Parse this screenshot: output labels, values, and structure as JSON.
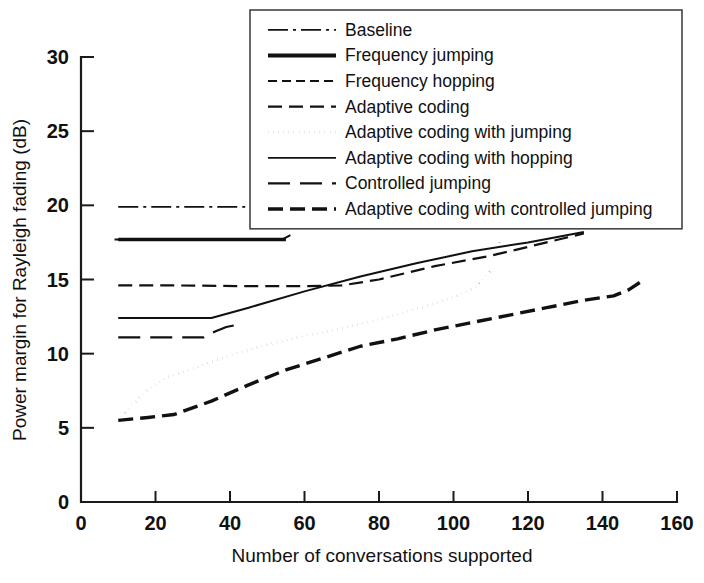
{
  "chart_data": {
    "type": "line",
    "title": "",
    "xlabel": "Number of conversations supported",
    "ylabel": "Power margin for Rayleigh fading (dB)",
    "xlim": [
      0,
      160
    ],
    "ylim": [
      0,
      30
    ],
    "xticks": [
      0,
      20,
      40,
      60,
      80,
      100,
      120,
      140,
      160
    ],
    "yticks": [
      0,
      5,
      10,
      15,
      20,
      25,
      30
    ],
    "xtick_labels": [
      "0",
      "20",
      "40",
      "60",
      "80",
      "100",
      "120",
      "140",
      "160"
    ],
    "ytick_labels": [
      "0",
      "5",
      "10",
      "15",
      "20",
      "25",
      "30"
    ],
    "grid": false,
    "legend_position": "top-center-right",
    "series": [
      {
        "name": "Baseline",
        "dash": "dashdot",
        "width": 1.8,
        "points": [
          [
            10,
            19.9
          ],
          [
            20,
            19.9
          ],
          [
            30,
            19.9
          ],
          [
            40,
            19.9
          ],
          [
            50,
            19.9
          ],
          [
            55,
            19.9
          ]
        ]
      },
      {
        "name": "Frequency jumping",
        "dash": "solid-thick",
        "width": 3.6,
        "points": [
          [
            10,
            17.7
          ],
          [
            20,
            17.7
          ],
          [
            30,
            17.7
          ],
          [
            40,
            17.7
          ],
          [
            50,
            17.7
          ],
          [
            55,
            17.7
          ]
        ]
      },
      {
        "name": "Frequency hopping",
        "dash": "dashed-short",
        "width": 2.0,
        "points": [
          [
            9,
            17.7
          ],
          [
            20,
            17.7
          ],
          [
            35,
            17.68
          ],
          [
            45,
            17.68
          ],
          [
            54,
            17.7
          ],
          [
            57,
            18.1
          ]
        ]
      },
      {
        "name": "Adaptive coding",
        "dash": "dashed-medium",
        "width": 2.2,
        "points": [
          [
            10,
            14.6
          ],
          [
            25,
            14.6
          ],
          [
            45,
            14.55
          ],
          [
            60,
            14.55
          ],
          [
            70,
            14.6
          ],
          [
            80,
            15.0
          ],
          [
            95,
            15.9
          ],
          [
            110,
            16.6
          ],
          [
            125,
            17.5
          ],
          [
            135,
            18.1
          ]
        ]
      },
      {
        "name": "Adaptive coding with jumping",
        "dash": "dotted",
        "width": 2.6,
        "points": [
          [
            10,
            5.5
          ],
          [
            14,
            6.6
          ],
          [
            18,
            7.6
          ],
          [
            23,
            8.4
          ],
          [
            30,
            9.0
          ],
          [
            40,
            9.9
          ],
          [
            50,
            10.6
          ],
          [
            60,
            11.2
          ],
          [
            70,
            11.7
          ],
          [
            80,
            12.3
          ],
          [
            90,
            13.0
          ],
          [
            100,
            13.8
          ],
          [
            106,
            14.5
          ],
          [
            110,
            15.6
          ],
          [
            112,
            17.0
          ],
          [
            113,
            18.3
          ],
          [
            113.5,
            19.5
          ]
        ]
      },
      {
        "name": "Adaptive coding with hopping",
        "dash": "solid",
        "width": 2.0,
        "points": [
          [
            10,
            12.4
          ],
          [
            20,
            12.4
          ],
          [
            30,
            12.4
          ],
          [
            35,
            12.4
          ],
          [
            45,
            13.1
          ],
          [
            60,
            14.2
          ],
          [
            75,
            15.2
          ],
          [
            90,
            16.1
          ],
          [
            105,
            16.9
          ],
          [
            120,
            17.5
          ],
          [
            135,
            18.2
          ]
        ]
      },
      {
        "name": "Controlled jumping",
        "dash": "dashed-long",
        "width": 2.2,
        "points": [
          [
            10,
            11.1
          ],
          [
            20,
            11.1
          ],
          [
            30,
            11.1
          ],
          [
            33,
            11.1
          ],
          [
            36,
            11.5
          ],
          [
            39,
            11.8
          ],
          [
            41,
            11.9
          ]
        ]
      },
      {
        "name": "Adaptive coding with controlled jumping",
        "dash": "dashed-thick",
        "width": 3.4,
        "points": [
          [
            10,
            5.5
          ],
          [
            18,
            5.7
          ],
          [
            25,
            5.9
          ],
          [
            35,
            6.8
          ],
          [
            45,
            7.9
          ],
          [
            55,
            8.9
          ],
          [
            65,
            9.7
          ],
          [
            75,
            10.5
          ],
          [
            85,
            11.0
          ],
          [
            95,
            11.6
          ],
          [
            105,
            12.1
          ],
          [
            115,
            12.6
          ],
          [
            125,
            13.1
          ],
          [
            135,
            13.6
          ],
          [
            143,
            13.9
          ],
          [
            147,
            14.3
          ],
          [
            150,
            14.8
          ]
        ]
      }
    ]
  },
  "legend": {
    "entries": [
      {
        "label": "Baseline",
        "dash": "dashdot",
        "width": 1.8
      },
      {
        "label": "Frequency jumping",
        "dash": "solid-thick",
        "width": 4.0
      },
      {
        "label": "Frequency hopping",
        "dash": "dashed-short",
        "width": 2.0
      },
      {
        "label": "Adaptive coding",
        "dash": "dashed-medium",
        "width": 2.4
      },
      {
        "label": "Adaptive coding with jumping",
        "dash": "dotted",
        "width": 2.6
      },
      {
        "label": "Adaptive coding with hopping",
        "dash": "solid",
        "width": 1.8
      },
      {
        "label": "Controlled jumping",
        "dash": "dashed-long",
        "width": 2.2
      },
      {
        "label": "Adaptive coding with controlled jumping",
        "dash": "dashed-thick",
        "width": 3.4
      }
    ]
  }
}
